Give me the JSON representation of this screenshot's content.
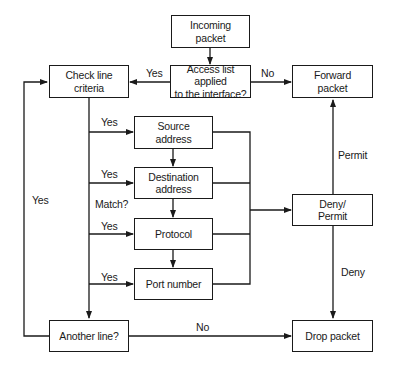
{
  "diagram": {
    "type": "flowchart",
    "nodes": {
      "incoming": "Incoming\npacket",
      "access_list": "Access list applied\nto the interface?",
      "check_line": "Check line\ncriteria",
      "forward": "Forward\npacket",
      "source": "Source\naddress",
      "destination": "Destination\naddress",
      "protocol": "Protocol",
      "port": "Port number",
      "deny_permit": "Deny/\nPermit",
      "another_line": "Another line?",
      "drop": "Drop packet"
    },
    "edge_labels": {
      "access_yes": "Yes",
      "access_no": "No",
      "source_yes": "Yes",
      "destination_yes": "Yes",
      "match": "Match?",
      "protocol_yes": "Yes",
      "port_yes": "Yes",
      "loop_yes": "Yes",
      "another_no": "No",
      "permit": "Permit",
      "deny": "Deny"
    }
  }
}
